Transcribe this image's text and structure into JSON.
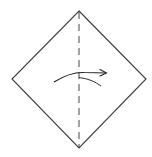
{
  "diagram": {
    "type": "origami-fold-step",
    "paper": {
      "shape": "diamond",
      "vertices": {
        "top": [
          79,
          11
        ],
        "right": [
          146,
          79
        ],
        "bottom": [
          79,
          148
        ],
        "left": [
          12,
          79
        ]
      },
      "stroke_color": "#3a3a3a",
      "fill_color": "#ffffff"
    },
    "fold_line": {
      "kind": "valley-fold",
      "style": "dashed",
      "from": [
        79,
        11
      ],
      "to": [
        79,
        148
      ],
      "dash": "7 5",
      "stroke_color": "#444444"
    },
    "fold_arrow": {
      "direction": "right",
      "start": [
        54,
        82
      ],
      "end": [
        106,
        73
      ],
      "stroke_color": "#222222"
    },
    "flap_curve": {
      "start": [
        79,
        77
      ],
      "end": [
        101,
        86
      ],
      "stroke_color": "#333333"
    },
    "labels": {
      "caption": "Valley fold in half, left to right"
    }
  }
}
